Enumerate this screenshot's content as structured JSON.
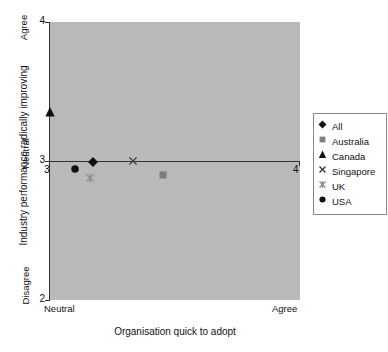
{
  "chart_data": {
    "type": "scatter",
    "title": "",
    "xlabel": "Organisation quick to adopt",
    "ylabel": "Industry performance radically improving",
    "xlim": [
      3,
      4
    ],
    "ylim": [
      2,
      4
    ],
    "grid": false,
    "legend_position": "right",
    "x_axis": {
      "title": "Organisation quick to adopt",
      "low_label": "Neutral",
      "high_label": "Agree",
      "ticks": [
        "3",
        "4"
      ],
      "tick_values": [
        3,
        4
      ]
    },
    "y_axis": {
      "title": "Industry performance radically improving",
      "low_label": "Disagree",
      "mid_label": "Neutral",
      "high_label": "Agree",
      "ticks": [
        "2",
        "3",
        "4"
      ],
      "tick_values": [
        2,
        3,
        4
      ]
    },
    "reference_line": {
      "axis": "y",
      "value": 3
    },
    "series": [
      {
        "name": "All",
        "marker": "diamond",
        "color": "#111111",
        "x": 3.17,
        "y": 2.99
      },
      {
        "name": "Australia",
        "marker": "square",
        "color": "#7d7d7d",
        "x": 3.45,
        "y": 2.9
      },
      {
        "name": "Canada",
        "marker": "triangle",
        "color": "#111111",
        "x": 3.0,
        "y": 3.35
      },
      {
        "name": "Singapore",
        "marker": "x",
        "color": "#3a3a3a",
        "x": 3.33,
        "y": 3.0
      },
      {
        "name": "UK",
        "marker": "asterisk",
        "color": "#8a8a8a",
        "x": 3.16,
        "y": 2.88
      },
      {
        "name": "USA",
        "marker": "circle",
        "color": "#111111",
        "x": 3.1,
        "y": 2.94
      }
    ]
  },
  "legend": {
    "items": [
      {
        "label": "All"
      },
      {
        "label": "Australia"
      },
      {
        "label": "Canada"
      },
      {
        "label": "Singapore"
      },
      {
        "label": "UK"
      },
      {
        "label": "USA"
      }
    ]
  },
  "colors": {
    "plot_background": "#b9b9b9",
    "page_background": "#ffffff",
    "axis": "#2b2b2b",
    "reference_line": "#333333",
    "legend_border": "#888888",
    "dark_marker": "#111111",
    "grey_marker": "#7d7d7d"
  }
}
